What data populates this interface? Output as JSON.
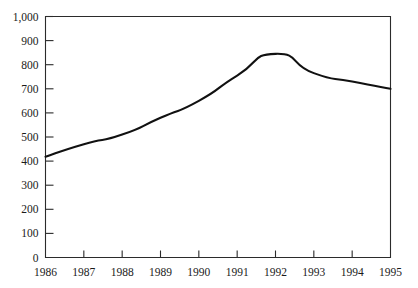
{
  "chart_data": {
    "type": "line",
    "title": "",
    "subtitle": "",
    "xlabel": "",
    "ylabel": "",
    "grid": false,
    "legend": null,
    "legend_position": "none",
    "line_color": "#111111",
    "axis_color": "#2b2b2b",
    "background_color": "#ffffff",
    "x": [
      1986,
      1987,
      1988,
      1989,
      1990,
      1991,
      1992,
      1993,
      1994,
      1995
    ],
    "categories": [
      "1986",
      "1987",
      "1988",
      "1989",
      "1990",
      "1991",
      "1992",
      "1993",
      "1994",
      "1995"
    ],
    "values": [
      418,
      470,
      510,
      580,
      650,
      755,
      845,
      765,
      730,
      700
    ],
    "series": [
      {
        "name": "value",
        "values": [
          418,
          470,
          510,
          580,
          650,
          755,
          845,
          765,
          730,
          700
        ]
      }
    ],
    "xlim": [
      1986,
      1995
    ],
    "ylim": [
      0,
      1000
    ],
    "ytick_values": [
      0,
      100,
      200,
      300,
      400,
      500,
      600,
      700,
      800,
      900,
      1000
    ],
    "ytick_labels": [
      "0",
      "100",
      "200",
      "300",
      "400",
      "500",
      "600",
      "700",
      "800",
      "900",
      "1,000"
    ],
    "xtick_labels": [
      "1986",
      "1987",
      "1988",
      "1989",
      "1990",
      "1991",
      "1992",
      "1993",
      "1994",
      "1995"
    ],
    "peak": {
      "x": "1992",
      "y": 845
    }
  }
}
